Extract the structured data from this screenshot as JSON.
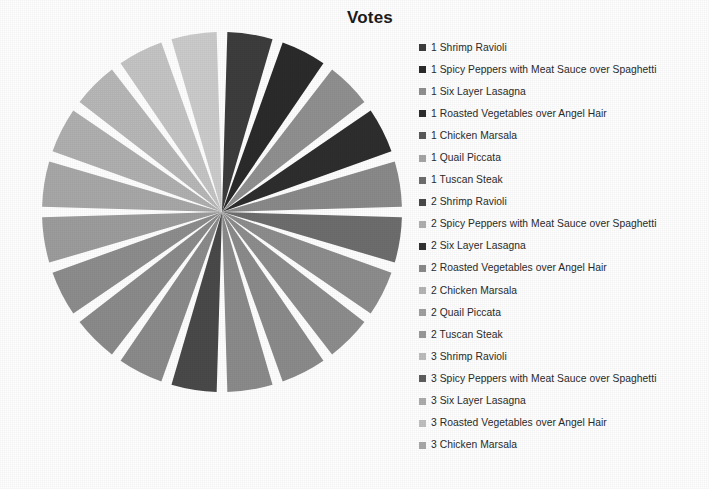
{
  "chart_data": {
    "type": "pie",
    "title": "Votes",
    "xlabel": "",
    "ylabel": "",
    "legend_position": "right",
    "grid": false,
    "equal_slices": true,
    "start_angle_deg": 0,
    "total_slices": 20,
    "categories": [
      "1 Shrimp Ravioli",
      "1 Spicy Peppers with Meat Sauce over Spaghetti",
      "1 Six Layer Lasagna",
      "1 Roasted Vegetables over Angel Hair",
      "1 Chicken  Marsala",
      "1 Quail Piccata",
      "1 Tuscan Steak",
      "2 Shrimp Ravioli",
      "2 Spicy Peppers with Meat Sauce over Spaghetti",
      "2 Six Layer Lasagna",
      "2 Roasted Vegetables over Angel Hair",
      "2 Chicken  Marsala",
      "2 Quail Piccata",
      "2 Tuscan Steak",
      "3 Shrimp Ravioli",
      "3 Spicy Peppers with Meat Sauce over Spaghetti",
      "3 Six Layer Lasagna",
      "3 Roasted Vegetables over Angel Hair",
      "3 Chicken  Marsala"
    ],
    "values": [
      1,
      1,
      1,
      1,
      1,
      1,
      1,
      1,
      1,
      1,
      1,
      1,
      1,
      1,
      1,
      1,
      1,
      1,
      1
    ],
    "slice_colors": [
      "#3d3d3d",
      "#2b2b2b",
      "#909090",
      "#2e2e2e",
      "#8a8a8a",
      "#6e6e6e",
      "#8d8d8d",
      "#8d8d8d",
      "#8b8b8b",
      "#8b8b8b",
      "#4a4a4a",
      "#8b8b8b",
      "#8b8b8b",
      "#8d8d8d",
      "#9d9d9d",
      "#a8a8a8",
      "#b0b0b0",
      "#b8b8b8",
      "#c5c5c5",
      "#cccccc"
    ],
    "slice_separator_color": "#ffffff"
  },
  "legend": {
    "items": [
      {
        "label": "1 Shrimp Ravioli",
        "color": "#3d3d3d"
      },
      {
        "label": "1 Spicy Peppers with Meat Sauce over  Spaghetti",
        "color": "#2b2b2b"
      },
      {
        "label": "1 Six Layer Lasagna",
        "color": "#909090"
      },
      {
        "label": "1 Roasted Vegetables over Angel Hair",
        "color": "#2e2e2e"
      },
      {
        "label": "1 Chicken  Marsala",
        "color": "#5a5a5a"
      },
      {
        "label": "1 Quail Piccata",
        "color": "#a6a6a6"
      },
      {
        "label": "1 Tuscan Steak",
        "color": "#6e6e6e"
      },
      {
        "label": "2 Shrimp Ravioli",
        "color": "#4a4a4a"
      },
      {
        "label": "2 Spicy Peppers with Meat Sauce over  Spaghetti",
        "color": "#b0b0b0"
      },
      {
        "label": "2 Six Layer Lasagna",
        "color": "#323232"
      },
      {
        "label": "2 Roasted Vegetables over Angel Hair",
        "color": "#8b8b8b"
      },
      {
        "label": "2 Chicken  Marsala",
        "color": "#b5b5b5"
      },
      {
        "label": "2 Quail Piccata",
        "color": "#a0a0a0"
      },
      {
        "label": "2 Tuscan Steak",
        "color": "#9a9a9a"
      },
      {
        "label": "3 Shrimp Ravioli",
        "color": "#bdbdbd"
      },
      {
        "label": "3 Spicy Peppers with Meat Sauce over Spaghetti",
        "color": "#5e5e5e"
      },
      {
        "label": "3 Six Layer Lasagna",
        "color": "#adadad"
      },
      {
        "label": "3 Roasted Vegetables over Angel Hair",
        "color": "#c0c0c0"
      },
      {
        "label": "3 Chicken  Marsala",
        "color": "#a9a9a9"
      }
    ]
  },
  "pie_geometry": {
    "center_x": 185,
    "center_y": 185,
    "radius": 180,
    "gap_deg": 3.4
  }
}
